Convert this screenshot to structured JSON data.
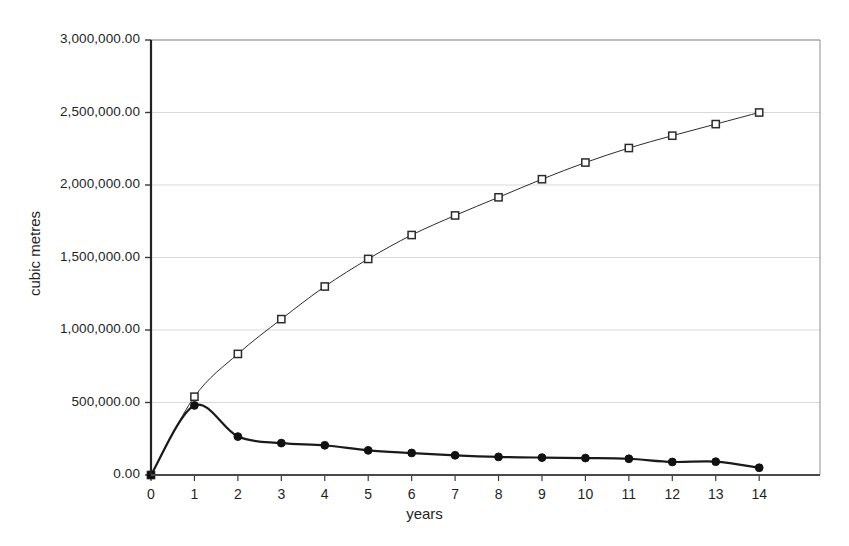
{
  "chart_data": {
    "type": "line",
    "title": "",
    "subtitle": "",
    "xlabel": "years",
    "ylabel": "cubic metres",
    "x": [
      0,
      1,
      2,
      3,
      4,
      5,
      6,
      7,
      8,
      9,
      10,
      11,
      12,
      13,
      14
    ],
    "xlim": [
      0,
      15.4
    ],
    "ylim": [
      0,
      3000000
    ],
    "xtick_labels": [
      "0",
      "1",
      "2",
      "3",
      "4",
      "5",
      "6",
      "7",
      "8",
      "9",
      "10",
      "11",
      "12",
      "13",
      "14"
    ],
    "ytick_values": [
      0,
      500000,
      1000000,
      1500000,
      2000000,
      2500000,
      3000000
    ],
    "ytick_labels": [
      "0.00",
      "500,000.00",
      "1,000,000.00",
      "1,500,000.00",
      "2,000,000.00",
      "2,500,000.00",
      "3,000,000.00"
    ],
    "grid": true,
    "grid_axis": "y",
    "legend": "none",
    "series": [
      {
        "name": "cumulative",
        "marker": "open-square",
        "marker_fill": "#ffffff",
        "color": "#2b2b2b",
        "line_width": 1,
        "values": [
          0,
          540000,
          835000,
          1075000,
          1300000,
          1490000,
          1655000,
          1790000,
          1915000,
          2040000,
          2155000,
          2255000,
          2340000,
          2420000,
          2500000
        ]
      },
      {
        "name": "annual",
        "marker": "filled-circle",
        "marker_fill": "#111111",
        "color": "#1a1a1a",
        "line_width": 2.2,
        "values": [
          0,
          480000,
          265000,
          220000,
          205000,
          170000,
          152000,
          136000,
          125000,
          120000,
          117000,
          112000,
          90000,
          92000,
          50000
        ]
      }
    ]
  },
  "colors": {
    "background": "#ffffff",
    "axis": "#3a3a3a",
    "gridline": "#d9d9d9",
    "text": "#1f1f1f",
    "series_primary": "#2b2b2b",
    "series_secondary": "#1a1a1a"
  }
}
